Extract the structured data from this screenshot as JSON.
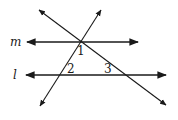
{
  "diagram": {
    "lines": [
      {
        "name": "m",
        "type": "parallel-line",
        "label": "m",
        "x1": 27,
        "y1": 42,
        "x2": 138,
        "y2": 42
      },
      {
        "name": "l",
        "type": "parallel-line",
        "label": "l",
        "x1": 26,
        "y1": 75,
        "x2": 166,
        "y2": 75
      },
      {
        "name": "transversal-a",
        "type": "transversal",
        "x1": 40,
        "y1": 106,
        "x2": 101,
        "y2": 10
      },
      {
        "name": "transversal-b",
        "type": "transversal",
        "x1": 39,
        "y1": 10,
        "x2": 166,
        "y2": 105
      }
    ],
    "line_labels": {
      "m": "m",
      "l": "l"
    },
    "angle_labels": {
      "a1": "1",
      "a2": "2",
      "a3": "3"
    },
    "stroke_color": "#1a1a1a"
  }
}
